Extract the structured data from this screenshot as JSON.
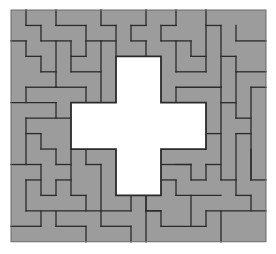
{
  "puzzle": {
    "title": "Polyomino tiling puzzle with cross-shaped hole",
    "grid": {
      "cols": 17,
      "rows": 15,
      "origin_x": 11,
      "origin_y": 10,
      "cell_w": 15,
      "cell_h": 15.45
    },
    "colors": {
      "fill": "#9c9c9c",
      "line": "#2a2a2a",
      "hole": "#ffffff",
      "background": "#ffffff"
    },
    "hole": {
      "shape": "cross",
      "cells_outline": [
        [
          7,
          3
        ],
        [
          10,
          3
        ],
        [
          10,
          6
        ],
        [
          13,
          6
        ],
        [
          13,
          9
        ],
        [
          10,
          9
        ],
        [
          10,
          12
        ],
        [
          7,
          12
        ],
        [
          7,
          9
        ],
        [
          4,
          9
        ],
        [
          4,
          6
        ],
        [
          7,
          6
        ]
      ]
    },
    "segments": [
      [
        1,
        0,
        1,
        1
      ],
      [
        1,
        1,
        2,
        1
      ],
      [
        2,
        1,
        2,
        2
      ],
      [
        2,
        2,
        4,
        2
      ],
      [
        3,
        0,
        3,
        1
      ],
      [
        3,
        1,
        5,
        1
      ],
      [
        5,
        1,
        5,
        3
      ],
      [
        4,
        3,
        5,
        3
      ],
      [
        4,
        2,
        4,
        4
      ],
      [
        4,
        4,
        6,
        4
      ],
      [
        5,
        2,
        6,
        2
      ],
      [
        6,
        0,
        6,
        1
      ],
      [
        6,
        1,
        7,
        1
      ],
      [
        7,
        1,
        7,
        3
      ],
      [
        6,
        2,
        7,
        2
      ],
      [
        6,
        2,
        6,
        6
      ],
      [
        0,
        2,
        1,
        2
      ],
      [
        1,
        2,
        1,
        3
      ],
      [
        1,
        3,
        2,
        3
      ],
      [
        2,
        3,
        2,
        4
      ],
      [
        2,
        4,
        3,
        4
      ],
      [
        3,
        2,
        3,
        5
      ],
      [
        3,
        5,
        5,
        5
      ],
      [
        5,
        5,
        5,
        6
      ],
      [
        1,
        5,
        3,
        5
      ],
      [
        1,
        5,
        1,
        6
      ],
      [
        0,
        6,
        3,
        6
      ],
      [
        3,
        6,
        3,
        7
      ],
      [
        8,
        1,
        9,
        1
      ],
      [
        8,
        1,
        8,
        2
      ],
      [
        8,
        2,
        9,
        2
      ],
      [
        9,
        0,
        9,
        1
      ],
      [
        9,
        2,
        9,
        3
      ],
      [
        11,
        0,
        11,
        1
      ],
      [
        10,
        1,
        11,
        1
      ],
      [
        10,
        1,
        10,
        2
      ],
      [
        10,
        2,
        12,
        2
      ],
      [
        12,
        2,
        12,
        3
      ],
      [
        11,
        2,
        11,
        4
      ],
      [
        11,
        4,
        13,
        4
      ],
      [
        11,
        5,
        14,
        5
      ],
      [
        11,
        5,
        11,
        6
      ],
      [
        13,
        0,
        13,
        1
      ],
      [
        13,
        1,
        14,
        1
      ],
      [
        14,
        1,
        14,
        5
      ],
      [
        15,
        1,
        15,
        2
      ],
      [
        15,
        2,
        17,
        2
      ],
      [
        12,
        3,
        13,
        3
      ],
      [
        13,
        1,
        13,
        4
      ],
      [
        14,
        3,
        15,
        3
      ],
      [
        15,
        3,
        15,
        4
      ],
      [
        15,
        4,
        17,
        4
      ],
      [
        14,
        5,
        14,
        6
      ],
      [
        16,
        5,
        17,
        5
      ],
      [
        16,
        5,
        16,
        11
      ],
      [
        15,
        4,
        15,
        7
      ],
      [
        15,
        7,
        16,
        7
      ],
      [
        14,
        6,
        15,
        6
      ],
      [
        14,
        6,
        14,
        11
      ],
      [
        13,
        8,
        14,
        8
      ],
      [
        15,
        8,
        16,
        8
      ],
      [
        15,
        8,
        15,
        12
      ],
      [
        11,
        10,
        12,
        10
      ],
      [
        12,
        10,
        12,
        11
      ],
      [
        12,
        11,
        13,
        11
      ],
      [
        13,
        10,
        13,
        11
      ],
      [
        13,
        10,
        14,
        10
      ],
      [
        10,
        10,
        12,
        10
      ],
      [
        10,
        11,
        11,
        11
      ],
      [
        11,
        11,
        11,
        12
      ],
      [
        11,
        12,
        14,
        12
      ],
      [
        14,
        11,
        15,
        11
      ],
      [
        15,
        12,
        16,
        12
      ],
      [
        16,
        12,
        16,
        13
      ],
      [
        16,
        9,
        16,
        11
      ],
      [
        16,
        11,
        17,
        11
      ],
      [
        13,
        13,
        17,
        13
      ],
      [
        13,
        13,
        13,
        14
      ],
      [
        12,
        12,
        12,
        14
      ],
      [
        10,
        14,
        13,
        14
      ],
      [
        10,
        13,
        10,
        14
      ],
      [
        9,
        13,
        10,
        13
      ],
      [
        9,
        12,
        9,
        15
      ],
      [
        14,
        13,
        14,
        15
      ],
      [
        1,
        7,
        4,
        7
      ],
      [
        1,
        7,
        1,
        10
      ],
      [
        1,
        8,
        2,
        8
      ],
      [
        2,
        8,
        2,
        9
      ],
      [
        2,
        9,
        3,
        9
      ],
      [
        3,
        9,
        3,
        10
      ],
      [
        3,
        10,
        4,
        10
      ],
      [
        0,
        10,
        2,
        10
      ],
      [
        2,
        10,
        2,
        12
      ],
      [
        2,
        12,
        3,
        12
      ],
      [
        3,
        11,
        3,
        12
      ],
      [
        3,
        11,
        4,
        11
      ],
      [
        4,
        9,
        4,
        12
      ],
      [
        4,
        12,
        5,
        12
      ],
      [
        5,
        12,
        5,
        13
      ],
      [
        5,
        9,
        5,
        10
      ],
      [
        5,
        10,
        6,
        10
      ],
      [
        6,
        10,
        6,
        13
      ],
      [
        1,
        11,
        2,
        11
      ],
      [
        1,
        11,
        1,
        13
      ],
      [
        1,
        13,
        8,
        13
      ],
      [
        0,
        14,
        2,
        14
      ],
      [
        2,
        13,
        2,
        14
      ],
      [
        3,
        13,
        3,
        14
      ],
      [
        3,
        14,
        5,
        14
      ],
      [
        5,
        14,
        5,
        15
      ],
      [
        6,
        13,
        6,
        14
      ],
      [
        6,
        14,
        8,
        14
      ],
      [
        8,
        14,
        8,
        15
      ],
      [
        8,
        12,
        8,
        13
      ],
      [
        9,
        12,
        9,
        13
      ],
      [
        9,
        13,
        10,
        13
      ]
    ]
  }
}
